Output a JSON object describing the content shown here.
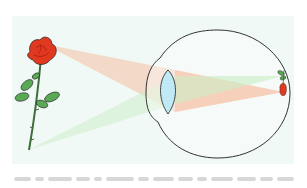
{
  "diagram": {
    "panel_color": "#f1f9f7",
    "object": {
      "label": "rose",
      "position": "left",
      "orientation": "upright"
    },
    "image": {
      "label": "inverted rose image on retina",
      "position": "right",
      "orientation": "inverted"
    },
    "eye": {
      "parts": [
        "cornea",
        "lens",
        "retina"
      ],
      "outline_color": "#333333",
      "lens_color": "#bfe9f5"
    },
    "rays": [
      {
        "name": "rays-from-flower-top",
        "color": "#f6b99a",
        "opacity": 0.45
      },
      {
        "name": "rays-from-stem-bottom",
        "color": "#c9ecc4",
        "opacity": 0.45
      }
    ],
    "colors": {
      "petal": "#e0391f",
      "petal_dark": "#9e1b10",
      "leaf": "#5aaa55",
      "stem": "#3c6e3a",
      "outline": "#222222"
    }
  },
  "caption": {
    "text_legible": false,
    "segments": [
      18,
      10,
      26,
      14,
      9,
      30,
      12,
      22,
      16,
      11,
      24,
      20,
      14,
      18
    ]
  }
}
